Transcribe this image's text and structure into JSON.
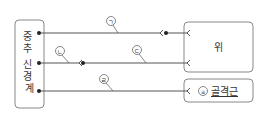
{
  "diagram": {
    "source_box": {
      "label": "중추 신경계"
    },
    "targets": [
      {
        "id": "stomach",
        "label": "위"
      },
      {
        "id": "skeletal_muscle",
        "marker": "ⓐ",
        "label": "골격근"
      }
    ],
    "pathways": [
      {
        "marker": "㉠",
        "from": "중추 신경계",
        "to": "위",
        "has_ganglion": true
      },
      {
        "marker": "㉡",
        "from": "중추 신경계",
        "to": "위",
        "has_ganglion": true
      },
      {
        "marker": "㉢",
        "from": "ganglion",
        "to": "위"
      },
      {
        "marker": "㉣",
        "from": "중추 신경계",
        "to": "골격근"
      }
    ]
  },
  "markers": {
    "a": "ㄱ",
    "b": "ㄴ",
    "c": "ㄷ",
    "d": "ㄹ"
  },
  "colors": {
    "line": "#555555",
    "box_border": "#888888",
    "text": "#333333"
  }
}
